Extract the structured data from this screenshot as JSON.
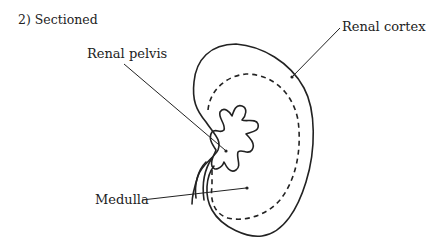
{
  "figure": {
    "title": "2) Sectioned",
    "labels": {
      "renal_pelvis": "Renal pelvis",
      "renal_cortex": "Renal cortex",
      "medulla": "Medulla"
    }
  },
  "colors": {
    "line": "#222222",
    "background": "#ffffff"
  }
}
